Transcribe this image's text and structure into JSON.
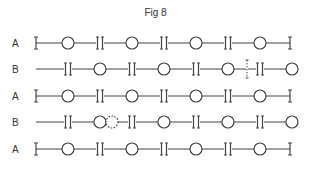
{
  "figure": {
    "title": "Fig 8",
    "rows": [
      {
        "label": "A",
        "type": "A",
        "y": 43
      },
      {
        "label": "B",
        "type": "B",
        "y": 69,
        "marker": {
          "kind": "dashed-cut",
          "x": 247
        }
      },
      {
        "label": "A",
        "type": "A",
        "y": 96
      },
      {
        "label": "B",
        "type": "B",
        "y": 122,
        "marker": {
          "kind": "dashed-circle",
          "x": 112
        }
      },
      {
        "label": "A",
        "type": "A",
        "y": 149
      }
    ],
    "layout": {
      "line_start": 36,
      "line_end": 291,
      "a_circles": [
        68,
        132,
        196,
        260
      ],
      "a_doubles": [
        100,
        164,
        228
      ],
      "a_singles": [
        36,
        290
      ],
      "b_doubles": [
        68,
        132,
        196,
        260
      ],
      "b_circles": [
        100,
        164,
        228,
        292
      ],
      "circle_radius": 6
    },
    "colors": {
      "stroke": "#444444",
      "label": "#333333"
    }
  }
}
